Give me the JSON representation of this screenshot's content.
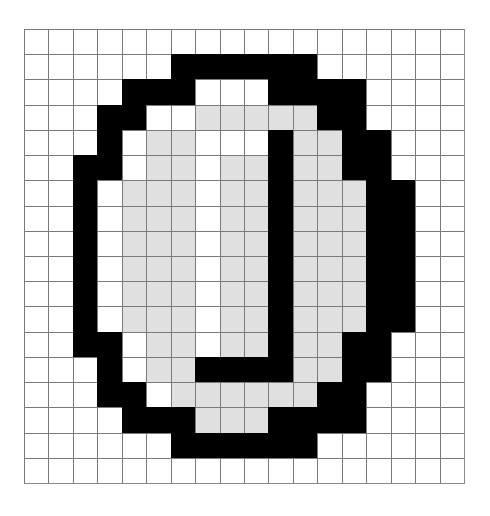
{
  "figure": {
    "rows": 18,
    "cols": 18,
    "legend": {
      "0": "white",
      "1": "light-gray",
      "2": "black"
    },
    "colors": {
      "0": "#ffffff",
      "1": "#e0e0e0",
      "2": "#000000",
      "gridline": "#7a7a7a"
    },
    "cells": [
      [
        0,
        0,
        0,
        0,
        0,
        0,
        0,
        0,
        0,
        0,
        0,
        0,
        0,
        0,
        0,
        0,
        0,
        0
      ],
      [
        0,
        0,
        0,
        0,
        0,
        0,
        2,
        2,
        2,
        2,
        2,
        2,
        0,
        0,
        0,
        0,
        0,
        0
      ],
      [
        0,
        0,
        0,
        0,
        2,
        2,
        2,
        0,
        0,
        0,
        2,
        2,
        2,
        2,
        0,
        0,
        0,
        0
      ],
      [
        0,
        0,
        0,
        2,
        2,
        0,
        0,
        1,
        1,
        1,
        1,
        1,
        2,
        2,
        0,
        0,
        0,
        0
      ],
      [
        0,
        0,
        0,
        2,
        0,
        1,
        1,
        0,
        0,
        0,
        2,
        1,
        1,
        2,
        2,
        0,
        0,
        0
      ],
      [
        0,
        0,
        2,
        2,
        0,
        1,
        1,
        0,
        1,
        1,
        2,
        1,
        1,
        2,
        2,
        0,
        0,
        0
      ],
      [
        0,
        0,
        2,
        0,
        1,
        1,
        1,
        0,
        1,
        1,
        2,
        1,
        1,
        1,
        2,
        2,
        0,
        0
      ],
      [
        0,
        0,
        2,
        0,
        1,
        1,
        1,
        0,
        1,
        1,
        2,
        1,
        1,
        1,
        2,
        2,
        0,
        0
      ],
      [
        0,
        0,
        2,
        0,
        1,
        1,
        1,
        0,
        1,
        1,
        2,
        1,
        1,
        1,
        2,
        2,
        0,
        0
      ],
      [
        0,
        0,
        2,
        0,
        1,
        1,
        1,
        0,
        1,
        1,
        2,
        1,
        1,
        1,
        2,
        2,
        0,
        0
      ],
      [
        0,
        0,
        2,
        0,
        1,
        1,
        1,
        0,
        1,
        1,
        2,
        1,
        1,
        1,
        2,
        2,
        0,
        0
      ],
      [
        0,
        0,
        2,
        0,
        1,
        1,
        1,
        0,
        1,
        1,
        2,
        1,
        1,
        1,
        2,
        2,
        0,
        0
      ],
      [
        0,
        0,
        2,
        2,
        0,
        1,
        1,
        0,
        1,
        1,
        2,
        1,
        1,
        2,
        2,
        0,
        0,
        0
      ],
      [
        0,
        0,
        0,
        2,
        0,
        1,
        1,
        2,
        2,
        2,
        2,
        1,
        1,
        2,
        2,
        0,
        0,
        0
      ],
      [
        0,
        0,
        0,
        2,
        2,
        0,
        1,
        1,
        1,
        1,
        1,
        1,
        2,
        2,
        0,
        0,
        0,
        0
      ],
      [
        0,
        0,
        0,
        0,
        2,
        2,
        2,
        1,
        1,
        1,
        2,
        2,
        2,
        2,
        0,
        0,
        0,
        0
      ],
      [
        0,
        0,
        0,
        0,
        0,
        0,
        2,
        2,
        2,
        2,
        2,
        2,
        0,
        0,
        0,
        0,
        0,
        0
      ],
      [
        0,
        0,
        0,
        0,
        0,
        0,
        0,
        0,
        0,
        0,
        0,
        0,
        0,
        0,
        0,
        0,
        0,
        0
      ]
    ]
  }
}
